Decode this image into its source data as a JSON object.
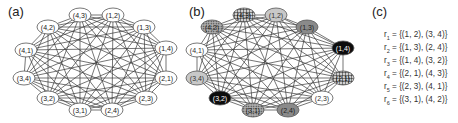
{
  "panels": {
    "a": {
      "label": "(a)"
    },
    "b": {
      "label": "(b)"
    },
    "c": {
      "label": "(c)"
    }
  },
  "nodes": [
    {
      "id": "4,3",
      "label": "(4,3)",
      "group": "r4"
    },
    {
      "id": "1,2",
      "label": "(1,2)",
      "group": "r1"
    },
    {
      "id": "1,3",
      "label": "(1,3)",
      "group": "r2"
    },
    {
      "id": "1,4",
      "label": "(1,4)",
      "group": "r3"
    },
    {
      "id": "2,1",
      "label": "(2,1)",
      "group": "r4"
    },
    {
      "id": "2,3",
      "label": "(2,3)",
      "group": "r5"
    },
    {
      "id": "2,4",
      "label": "(2,4)",
      "group": "r2"
    },
    {
      "id": "3,1",
      "label": "(3,1)",
      "group": "r6"
    },
    {
      "id": "3,2",
      "label": "(3,2)",
      "group": "r3"
    },
    {
      "id": "3,4",
      "label": "(3,4)",
      "group": "r1"
    },
    {
      "id": "4,1",
      "label": "(4,1)",
      "group": "r5"
    },
    {
      "id": "4,2",
      "label": "(4,2)",
      "group": "r6"
    }
  ],
  "graph_a_positions": {
    "4,3": [
      80,
      15
    ],
    "1,2": [
      113,
      15
    ],
    "1,3": [
      144,
      27
    ],
    "1,4": [
      166,
      48
    ],
    "2,1": [
      166,
      78
    ],
    "2,3": [
      146,
      98
    ],
    "2,4": [
      112,
      110
    ],
    "3,1": [
      80,
      110
    ],
    "3,2": [
      48,
      98
    ],
    "3,4": [
      24,
      78
    ],
    "4,1": [
      26,
      50
    ],
    "4,2": [
      48,
      27
    ]
  },
  "graph_b_positions": {
    "4,3": [
      244,
      15
    ],
    "1,2": [
      276,
      15
    ],
    "1,3": [
      307,
      27
    ],
    "1,4": [
      343,
      48
    ],
    "2,1": [
      343,
      78
    ],
    "2,3": [
      322,
      98
    ],
    "2,4": [
      288,
      110
    ],
    "3,1": [
      253,
      110
    ],
    "3,2": [
      220,
      98
    ],
    "3,4": [
      197,
      78
    ],
    "4,1": [
      197,
      50
    ],
    "4,2": [
      212,
      27
    ]
  },
  "group_styles": {
    "r1": {
      "fill": "#c8c8c8",
      "text": "#333333",
      "pattern": "none"
    },
    "r2": {
      "fill": "#8a8a8a",
      "text": "#222222",
      "pattern": "none"
    },
    "r3": {
      "fill": "#0d0d0d",
      "text": "#ffffff",
      "pattern": "none"
    },
    "r4": {
      "fill": "#bdbdbd",
      "text": "#111111",
      "pattern": "grid"
    },
    "r5": {
      "fill": "#ffffff",
      "text": "#333333",
      "pattern": "none"
    },
    "r6": {
      "fill": "#a8a8a8",
      "text": "#222222",
      "pattern": "dots"
    }
  },
  "legend": {
    "rows": [
      {
        "name": "r",
        "sub": "1",
        "value": " = {(1, 2), (3, 4)}"
      },
      {
        "name": "r",
        "sub": "2",
        "value": " = {(1, 3), (2, 4)}"
      },
      {
        "name": "r",
        "sub": "3",
        "value": " = {(1, 4), (3, 2)}"
      },
      {
        "name": "r",
        "sub": "4",
        "value": " = {(2, 1), (4, 3)}"
      },
      {
        "name": "r",
        "sub": "5",
        "value": " = {(2, 3), (4, 1)}"
      },
      {
        "name": "r",
        "sub": "6",
        "value": " = {(3, 1), (4, 2)}"
      }
    ]
  },
  "colors": {
    "edge": "#3a3a3a",
    "node_stroke": "#555555",
    "label": "#222222"
  }
}
